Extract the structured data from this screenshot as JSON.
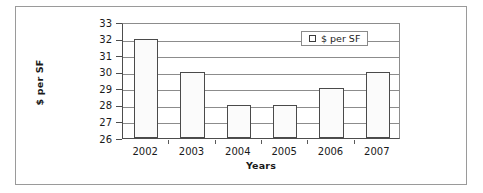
{
  "chart_data": {
    "type": "bar",
    "title": "",
    "categories": [
      "2002",
      "2003",
      "2004",
      "2005",
      "2006",
      "2007"
    ],
    "values": [
      32,
      30,
      28,
      28,
      29,
      30
    ],
    "series": [
      {
        "name": "$ per SF",
        "values": [
          32,
          30,
          28,
          28,
          29,
          30
        ]
      }
    ],
    "xlabel": "Years",
    "ylabel": "$ per SF",
    "ylim": [
      26,
      33
    ],
    "ytick_step": 1,
    "yticks": [
      "33",
      "32",
      "31",
      "30",
      "29",
      "28",
      "27",
      "26"
    ],
    "grid": true,
    "legend": {
      "position": "top-right-inside",
      "entries": [
        {
          "label": "$ per SF",
          "marker": "open-square"
        }
      ]
    },
    "colors": {
      "bar_fill": "#fbfbfb",
      "bar_edge": "#4a4a4a",
      "gridline": "#8c8c8c",
      "axis": "#4d4d4d",
      "text": "#1a1a1a",
      "frame": "#9a9a9a"
    }
  },
  "legend": {
    "swatch_name": "open-square-marker",
    "label": "$ per SF"
  },
  "axes": {
    "x_title": "Years",
    "y_title": "$ per SF"
  }
}
